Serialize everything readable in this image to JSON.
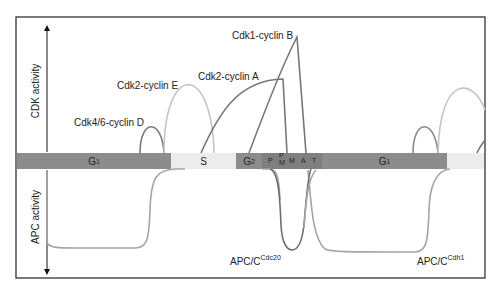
{
  "figure": {
    "y_axis_top_label": "CDK activity",
    "y_axis_bottom_label": "APC activity",
    "colors": {
      "frame": "#222222",
      "phase_dark": "#8c8c8c",
      "phase_mitosis": "#7a7a7a",
      "phase_light": "#ececec",
      "curve_dark": "#6e6e6e",
      "curve_light": "#bdbdbd",
      "curve_mid": "#9a9a9a"
    }
  },
  "cdk_curves": [
    {
      "name": "Cdk4/6-cyclin D",
      "label": "Cdk4/6-cyclin D"
    },
    {
      "name": "Cdk2-cyclin E",
      "label": "Cdk2-cyclin E"
    },
    {
      "name": "Cdk2-cyclin A",
      "label": "Cdk2-cyclin A"
    },
    {
      "name": "Cdk1-cyclin B",
      "label": "Cdk1-cyclin B"
    }
  ],
  "apc_curves": [
    {
      "name": "APC/C-Cdc20",
      "label_main": "APC/C",
      "label_sup": "Cdc20"
    },
    {
      "name": "APC/C-Cdh1",
      "label_main": "APC/C",
      "label_sup": "Cdh1"
    }
  ],
  "phases": [
    {
      "id": "g1a",
      "main": "G",
      "sub": "1"
    },
    {
      "id": "s",
      "main": "S",
      "sub": ""
    },
    {
      "id": "g2",
      "main": "G",
      "sub": "2"
    },
    {
      "id": "p",
      "main": "P"
    },
    {
      "id": "pm",
      "top": "P",
      "bottom": "M"
    },
    {
      "id": "m",
      "main": "M"
    },
    {
      "id": "a",
      "main": "A"
    },
    {
      "id": "t",
      "main": "T"
    },
    {
      "id": "g1b",
      "main": "G",
      "sub": "1"
    }
  ]
}
